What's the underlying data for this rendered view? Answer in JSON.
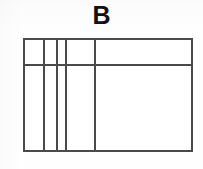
{
  "figure": {
    "label": "B",
    "label_position": "top-center",
    "background_color": "#ffffff",
    "line_color": "#4a4a4a",
    "line_width_px": 2
  },
  "diagram": {
    "type": "partitioned-rectangle",
    "frame": {
      "left": 23,
      "top": 38,
      "right": 193,
      "bottom": 152,
      "width": 170,
      "height": 114
    },
    "horizontal_rules": [
      {
        "id": "header-rule",
        "y": 64,
        "y_rel": 26,
        "spans": "full-width"
      }
    ],
    "vertical_rules": [
      {
        "id": "divider-1",
        "x": 43,
        "x_rel": 20,
        "spans": "full-height"
      },
      {
        "id": "divider-2",
        "x": 56,
        "x_rel": 33,
        "spans": "full-height"
      },
      {
        "id": "divider-3",
        "x": 65,
        "x_rel": 42,
        "spans": "full-height"
      },
      {
        "id": "divider-4",
        "x": 94,
        "x_rel": 71,
        "spans": "full-height"
      }
    ],
    "columns": [
      {
        "id": "column-1",
        "x_rel": 0,
        "width_rel": 20,
        "label": ""
      },
      {
        "id": "column-2",
        "x_rel": 20,
        "width_rel": 13,
        "label": ""
      },
      {
        "id": "column-3",
        "x_rel": 33,
        "width_rel": 9,
        "label": ""
      },
      {
        "id": "column-4",
        "x_rel": 42,
        "width_rel": 29,
        "label": ""
      },
      {
        "id": "column-5",
        "x_rel": 71,
        "width_rel": 99,
        "label": ""
      }
    ],
    "rows": [
      {
        "id": "row-header",
        "y_rel": 0,
        "height_rel": 26,
        "label": ""
      },
      {
        "id": "row-body",
        "y_rel": 26,
        "height_rel": 88,
        "label": ""
      }
    ]
  },
  "chart_data": {
    "type": "table",
    "title": "B",
    "xlabel": "",
    "ylabel": "",
    "columns": [
      "",
      "",
      "",
      "",
      ""
    ],
    "rows": [
      [
        "",
        "",
        "",
        "",
        ""
      ],
      [
        "",
        "",
        "",
        "",
        ""
      ]
    ],
    "column_widths": [
      20,
      13,
      9,
      29,
      99
    ],
    "row_heights": [
      26,
      88
    ],
    "grid": true,
    "legend": "none",
    "annotations": [
      "B"
    ]
  }
}
